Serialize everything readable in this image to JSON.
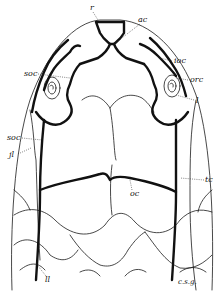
{
  "figure": {
    "labels": {
      "r": "r",
      "ac": "ac",
      "ioc": "ioc",
      "orc": "orc",
      "soc_upper": "soc",
      "l": "l",
      "jl": "jl",
      "soc_lower": "soc",
      "tc": "tc",
      "oc": "oc",
      "ll": "ll"
    },
    "signature": "c.s.g."
  }
}
